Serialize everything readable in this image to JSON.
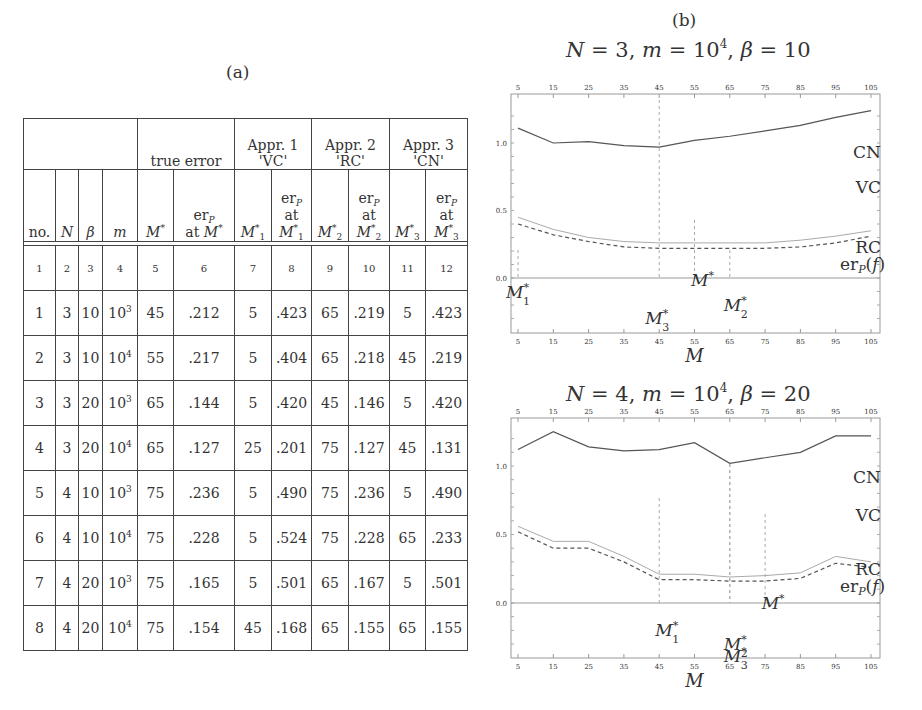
{
  "panels": {
    "a_label": "(a)",
    "b_label": "(b)"
  },
  "table": {
    "group_headers": [
      "true error",
      "Appr. 1",
      "'VC'",
      "Appr. 2",
      "'RC'",
      "Appr. 3",
      "'CN'"
    ],
    "column_headers": [
      "no.",
      "N",
      "β",
      "m",
      "M*",
      "erP at M*",
      "M1*",
      "erP at M1*",
      "M2*",
      "erP at M2*",
      "M3*",
      "erP at M3*"
    ],
    "column_index": [
      "1",
      "2",
      "3",
      "4",
      "5",
      "6",
      "7",
      "8",
      "9",
      "10",
      "11",
      "12"
    ],
    "rows": [
      {
        "no": "1",
        "N": "3",
        "beta": "10",
        "m_base": "10",
        "m_exp": "3",
        "Mstar": "45",
        "er": ".212",
        "M1": "5",
        "er1": ".423",
        "M2": "65",
        "er2": ".219",
        "M3": "5",
        "er3": ".423"
      },
      {
        "no": "2",
        "N": "3",
        "beta": "10",
        "m_base": "10",
        "m_exp": "4",
        "Mstar": "55",
        "er": ".217",
        "M1": "5",
        "er1": ".404",
        "M2": "65",
        "er2": ".218",
        "M3": "45",
        "er3": ".219"
      },
      {
        "no": "3",
        "N": "3",
        "beta": "20",
        "m_base": "10",
        "m_exp": "3",
        "Mstar": "65",
        "er": ".144",
        "M1": "5",
        "er1": ".420",
        "M2": "45",
        "er2": ".146",
        "M3": "5",
        "er3": ".420"
      },
      {
        "no": "4",
        "N": "3",
        "beta": "20",
        "m_base": "10",
        "m_exp": "4",
        "Mstar": "65",
        "er": ".127",
        "M1": "25",
        "er1": ".201",
        "M2": "75",
        "er2": ".127",
        "M3": "45",
        "er3": ".131"
      },
      {
        "no": "5",
        "N": "4",
        "beta": "10",
        "m_base": "10",
        "m_exp": "3",
        "Mstar": "75",
        "er": ".236",
        "M1": "5",
        "er1": ".490",
        "M2": "75",
        "er2": ".236",
        "M3": "5",
        "er3": ".490"
      },
      {
        "no": "6",
        "N": "4",
        "beta": "10",
        "m_base": "10",
        "m_exp": "4",
        "Mstar": "75",
        "er": ".228",
        "M1": "5",
        "er1": ".524",
        "M2": "75",
        "er2": ".228",
        "M3": "65",
        "er3": ".233"
      },
      {
        "no": "7",
        "N": "4",
        "beta": "20",
        "m_base": "10",
        "m_exp": "3",
        "Mstar": "75",
        "er": ".165",
        "M1": "5",
        "er1": ".501",
        "M2": "65",
        "er2": ".167",
        "M3": "5",
        "er3": ".501"
      },
      {
        "no": "8",
        "N": "4",
        "beta": "20",
        "m_base": "10",
        "m_exp": "4",
        "Mstar": "75",
        "er": ".154",
        "M1": "45",
        "er1": ".168",
        "M2": "65",
        "er2": ".155",
        "M3": "65",
        "er3": ".155"
      }
    ]
  },
  "chart_data": [
    {
      "type": "line",
      "title": "N = 3, m = 10^4, β = 10",
      "title_parts": {
        "N": "3",
        "m_base": "10",
        "m_exp": "4",
        "beta": "10"
      },
      "xlabel": "M",
      "x": [
        5,
        15,
        25,
        35,
        45,
        55,
        65,
        75,
        85,
        95,
        105
      ],
      "xticks": [
        5,
        15,
        25,
        35,
        45,
        55,
        65,
        75,
        85,
        95,
        105
      ],
      "yticks": [
        0.0,
        0.5,
        1.0
      ],
      "ytick_labels": [
        "0.0",
        "0.5",
        "1.0"
      ],
      "ylim": [
        -0.4,
        1.3
      ],
      "series": [
        {
          "name": "CN",
          "style": "solid",
          "values": [
            1.11,
            1.0,
            1.01,
            0.98,
            0.97,
            1.02,
            1.05,
            1.09,
            1.13,
            1.19,
            1.24
          ]
        },
        {
          "name": "VC",
          "style": "solid",
          "values": null
        },
        {
          "name": "RC",
          "style": "thin",
          "values": [
            0.45,
            0.36,
            0.3,
            0.27,
            0.26,
            0.26,
            0.26,
            0.26,
            0.28,
            0.31,
            0.35
          ]
        },
        {
          "name": "erP(f)",
          "style": "dashed",
          "values": [
            0.4,
            0.32,
            0.27,
            0.23,
            0.22,
            0.22,
            0.22,
            0.22,
            0.23,
            0.26,
            0.31
          ]
        }
      ],
      "legend_labels": [
        "CN",
        "VC",
        "RC",
        "erP(f)"
      ],
      "markers": [
        {
          "label": "M1*",
          "x": 5
        },
        {
          "label": "M*",
          "x": 55
        },
        {
          "label": "M2*",
          "x": 65
        },
        {
          "label": "M3*",
          "x": 45
        }
      ]
    },
    {
      "type": "line",
      "title": "N = 4, m = 10^4, β = 20",
      "title_parts": {
        "N": "4",
        "m_base": "10",
        "m_exp": "4",
        "beta": "20"
      },
      "xlabel": "M",
      "x": [
        5,
        15,
        25,
        35,
        45,
        55,
        65,
        75,
        85,
        95,
        105
      ],
      "xticks": [
        5,
        15,
        25,
        35,
        45,
        55,
        65,
        75,
        85,
        95,
        105
      ],
      "yticks": [
        0.0,
        0.5,
        1.0
      ],
      "ytick_labels": [
        "0.0",
        "0.5",
        "1.0"
      ],
      "ylim": [
        -0.4,
        1.3
      ],
      "series": [
        {
          "name": "CN",
          "style": "solid",
          "values": [
            1.12,
            1.25,
            1.14,
            1.11,
            1.12,
            1.17,
            1.02,
            1.06,
            1.1,
            1.22,
            1.22
          ]
        },
        {
          "name": "VC",
          "style": "solid",
          "values": null
        },
        {
          "name": "RC",
          "style": "thin",
          "values": [
            0.56,
            0.45,
            0.45,
            0.34,
            0.21,
            0.21,
            0.19,
            0.2,
            0.22,
            0.34,
            0.3
          ]
        },
        {
          "name": "erP(f)",
          "style": "dashed",
          "values": [
            0.52,
            0.4,
            0.4,
            0.3,
            0.17,
            0.17,
            0.16,
            0.16,
            0.18,
            0.29,
            0.26
          ]
        }
      ],
      "legend_labels": [
        "CN",
        "VC",
        "RC",
        "erP(f)"
      ],
      "markers": [
        {
          "label": "M1*",
          "x": 45
        },
        {
          "label": "M*",
          "x": 75
        },
        {
          "label": "M2*",
          "x": 65
        },
        {
          "label": "M3*",
          "x": 65
        }
      ]
    }
  ]
}
